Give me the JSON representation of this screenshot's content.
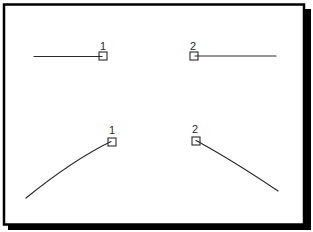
{
  "palette": {
    "paper": "#ffffff",
    "ink": "#2b2b2b",
    "frame": "#000000",
    "shadow": "#000000"
  },
  "diagram": {
    "items": [
      {
        "label": "1",
        "shape": "straight-line",
        "line": {
          "x1": 34,
          "y1": 56.5,
          "x2": 102,
          "y2": 56.5
        },
        "marker": {
          "x": 99,
          "y": 52,
          "size": 8
        },
        "label_anchor": {
          "x": 103,
          "y": 50
        }
      },
      {
        "label": "2",
        "shape": "straight-line",
        "line": {
          "x1": 195,
          "y1": 56,
          "x2": 276,
          "y2": 56
        },
        "marker": {
          "x": 190,
          "y": 52,
          "size": 8
        },
        "label_anchor": {
          "x": 193,
          "y": 50
        }
      },
      {
        "label": "1",
        "shape": "curved-line",
        "path": "M26,198 Q73,160 111,141.5",
        "marker": {
          "x": 108,
          "y": 138,
          "size": 8
        },
        "label_anchor": {
          "x": 112,
          "y": 134
        }
      },
      {
        "label": "2",
        "shape": "curved-line",
        "path": "M196,140.5 Q232,160 278,191",
        "marker": {
          "x": 192,
          "y": 137,
          "size": 8
        },
        "label_anchor": {
          "x": 195,
          "y": 133
        }
      }
    ]
  }
}
